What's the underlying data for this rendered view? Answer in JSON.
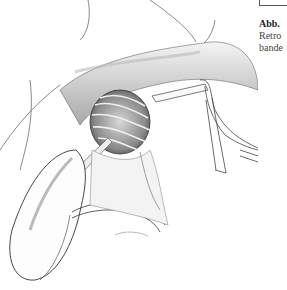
{
  "page": {
    "type": "surgical-book-scan",
    "caption": {
      "figure_label": "Abb.",
      "lines": [
        "Retro",
        "bande"
      ]
    },
    "illustration": {
      "subject": "surgical-line-drawing",
      "elements": [
        "tissue-folds",
        "exposed-muscle-fibers",
        "retractor-hook",
        "curved-spatula-retractor",
        "tape-loop",
        "forceps"
      ]
    }
  }
}
